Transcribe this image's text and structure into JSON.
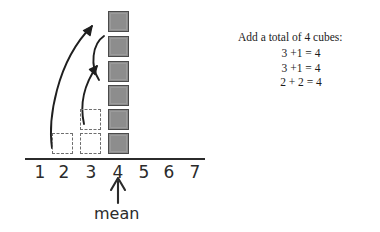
{
  "diagram": {
    "axis": {
      "tick_labels": [
        "1",
        "2",
        "3",
        "4",
        "5",
        "6",
        "7"
      ],
      "mean_label": "mean",
      "mean_position": "4"
    },
    "stack": {
      "column": "4",
      "cube_count": 6,
      "cube_color": "#8d8d8d",
      "cube_border_color": "#4a4a4a"
    },
    "ghost_cubes": [
      {
        "column": "2",
        "level": 1
      },
      {
        "column": "3",
        "level": 1
      },
      {
        "column": "3",
        "level": 2
      }
    ],
    "arrows": [
      {
        "name": "arrow-from-column-2",
        "from": "2",
        "to": "stack-top"
      },
      {
        "name": "arrow-from-column-3",
        "from": "3",
        "to": "stack-middle"
      },
      {
        "name": "arrow-bracket-curve",
        "from": "stack-upper",
        "to": "stack-middle"
      }
    ]
  },
  "notes": {
    "caption": "Add a total of 4 cubes:",
    "equations": [
      "3 +1 = 4",
      "3 +1 = 4",
      "2 + 2 = 4"
    ]
  },
  "colors": {
    "ink": "#2b2b2b",
    "cube_fill": "#8d8d8d",
    "cube_stroke": "#4a4a4a",
    "ghost_stroke": "#6f6f6f",
    "background": "#ffffff"
  }
}
